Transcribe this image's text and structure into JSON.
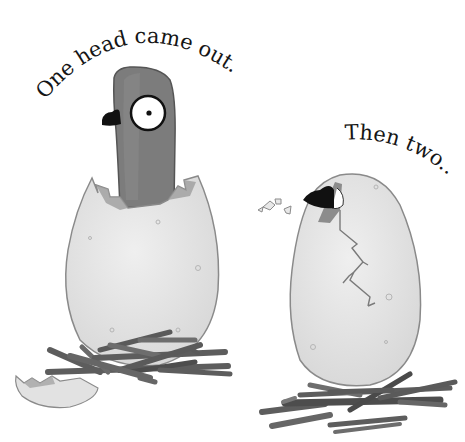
{
  "page": {
    "background": "#ffffff",
    "captions": [
      {
        "id": "caption-one",
        "text": "One head came out."
      },
      {
        "id": "caption-two",
        "text": "Then two..."
      }
    ]
  },
  "illustration": {
    "left_egg": {
      "description": "hatched egg with pigeon head poking out, sitting on twig nest",
      "shell_color": "#e4e4e4",
      "outline_color": "#8a8a8a",
      "pigeon_head_color": "#7c7c7c",
      "beak_color": "#111111",
      "eye_color": "#ffffff",
      "pupil_color": "#111111"
    },
    "right_egg": {
      "description": "cracked egg with a beak poking through a hole at top-left, shell fragments flying",
      "shell_color": "#e6e6e6",
      "outline_color": "#8a8a8a",
      "crack_color": "#7a7a7a"
    },
    "nest_color": "#5d5d5d",
    "nest_highlight": "#7e7e7e"
  }
}
